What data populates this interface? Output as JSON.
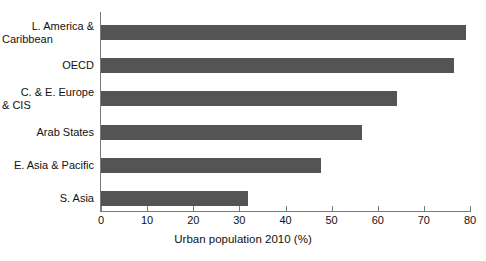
{
  "chart_data": {
    "type": "bar",
    "orientation": "horizontal",
    "title": "",
    "xlabel": "Urban population 2010 (%)",
    "ylabel": "",
    "categories": [
      "L. America & Caribbean",
      "OECD",
      "C. & E. Europe & CIS",
      "Arab States",
      "E. Asia & Pacific",
      "S. Asia"
    ],
    "category_lines": [
      [
        "L. America &",
        "Caribbean"
      ],
      [
        "OECD"
      ],
      [
        "C. & E. Europe",
        "& CIS"
      ],
      [
        "Arab States"
      ],
      [
        "E. Asia & Pacific"
      ],
      [
        "S. Asia"
      ]
    ],
    "values": [
      79.1,
      76.5,
      64.2,
      56.6,
      47.7,
      31.9
    ],
    "xlim": [
      0,
      80
    ],
    "xticks": [
      0,
      10,
      20,
      30,
      40,
      50,
      60,
      70,
      80
    ],
    "xtick_labels": [
      "0",
      "10",
      "20",
      "30",
      "40",
      "50",
      "60",
      "70",
      "80"
    ],
    "grid": false,
    "legend": null,
    "bar_color": "#545454",
    "axis_color": "#7a7a7a"
  }
}
